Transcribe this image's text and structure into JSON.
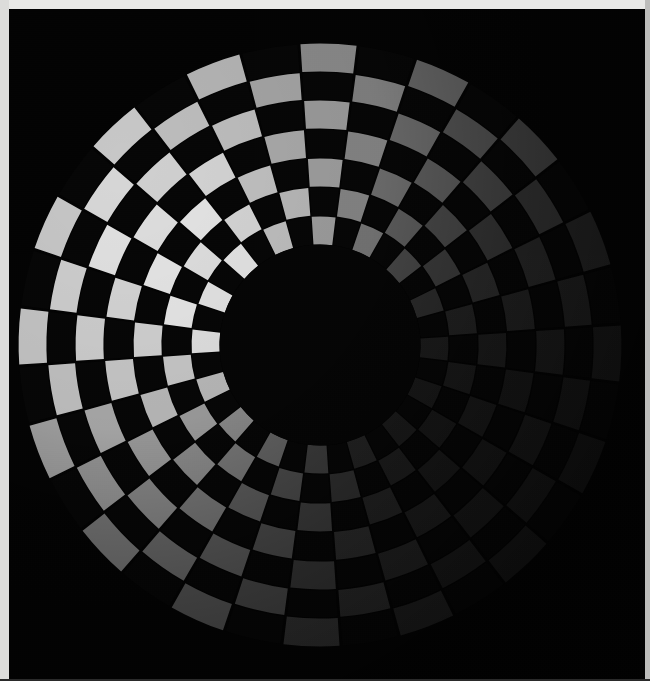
{
  "image": {
    "title": "Radial checkerboard test target",
    "width": 650,
    "height": 681,
    "background_color": "#000000",
    "frame_color": "#e9e9e7",
    "frame_color_right": "#bdbdbb"
  },
  "chart_data": {
    "type": "heatmap",
    "subtitle": "Polar checkerboard with dark central disc under directional illumination",
    "xlabel": "",
    "ylabel": "",
    "grid": false,
    "legend": "none",
    "geometry": {
      "center_x": 320,
      "center_y": 345,
      "inner_radius": 100,
      "outer_radius": 302,
      "angular_sectors": 32,
      "radial_rings": 7,
      "start_angle_deg": -4,
      "ring_boundaries": [
        100,
        129,
        158,
        187,
        216,
        245,
        273,
        302
      ]
    },
    "illumination": {
      "model": "directional-falloff",
      "light_direction_deg": 208,
      "brightest_point": [
        95,
        225
      ],
      "max_tile_luminance": 232,
      "min_tile_luminance": 26,
      "dark_tile_luminance": 6,
      "background_luminance": 4
    },
    "palette": {
      "light_tile_max": "#e8e8e6",
      "light_tile_mid": "#9a9a98",
      "light_tile_min": "#1a1a1a",
      "dark_tile": "#060606",
      "center_disc": "#050505",
      "background": "#030303"
    },
    "categories": [
      "ring-1",
      "ring-2",
      "ring-3",
      "ring-4",
      "ring-5",
      "ring-6",
      "ring-7"
    ],
    "values": [
      100,
      129,
      158,
      187,
      216,
      245,
      273
    ]
  }
}
